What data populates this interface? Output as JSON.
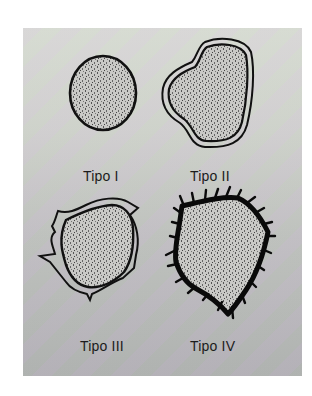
{
  "figure": {
    "panel_colors": {
      "top": "#d9dbd4",
      "bottom": "#acacad",
      "outline": "#111111",
      "fill": "#bfbfbd"
    },
    "types": [
      {
        "id": "tipo-1",
        "label": "Tipo I",
        "shape": "round-smooth-single-outline"
      },
      {
        "id": "tipo-2",
        "label": "Tipo II",
        "shape": "irregular-double-outline"
      },
      {
        "id": "tipo-3",
        "label": "Tipo III",
        "shape": "double-outline-with-spiked-projections"
      },
      {
        "id": "tipo-4",
        "label": "Tipo IV",
        "shape": "irregular-spiculated-thick-border"
      }
    ]
  }
}
